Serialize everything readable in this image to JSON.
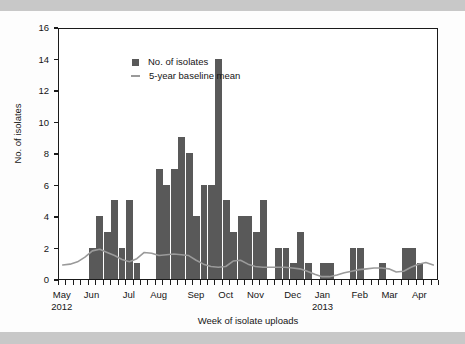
{
  "figure": {
    "background_color": "#fdfdfd",
    "band_color": "#c8c8c8",
    "bar_color": "#595959",
    "line_color": "#9a9a9a",
    "axis_color": "#1a1a1a"
  },
  "legend": {
    "position": "top-left-inside",
    "items": [
      {
        "label": "No. of isolates",
        "marker": "square-swatch",
        "color": "#595959"
      },
      {
        "label": "5-year baseline mean",
        "marker": "line-swatch",
        "color": "#9a9a9a"
      }
    ]
  },
  "axes": {
    "y": {
      "title": "No. of isolates",
      "ticks": [
        0,
        2,
        4,
        6,
        8,
        10,
        12,
        14,
        16
      ],
      "min": 0,
      "max": 16
    },
    "x": {
      "title": "Week of isolate uploads",
      "month_labels": [
        {
          "label": "May",
          "sublabel": "2012",
          "week_index": 0
        },
        {
          "label": "Jun",
          "sublabel": "",
          "week_index": 4
        },
        {
          "label": "Jul",
          "sublabel": "",
          "week_index": 9
        },
        {
          "label": "Aug",
          "sublabel": "",
          "week_index": 13
        },
        {
          "label": "Sep",
          "sublabel": "",
          "week_index": 18
        },
        {
          "label": "Oct",
          "sublabel": "",
          "week_index": 22
        },
        {
          "label": "Nov",
          "sublabel": "",
          "week_index": 26
        },
        {
          "label": "Dec",
          "sublabel": "",
          "week_index": 31
        },
        {
          "label": "Jan",
          "sublabel": "2013",
          "week_index": 35
        },
        {
          "label": "Feb",
          "sublabel": "",
          "week_index": 40
        },
        {
          "label": "Mar",
          "sublabel": "",
          "week_index": 44
        },
        {
          "label": "Apr",
          "sublabel": "",
          "week_index": 48
        }
      ],
      "n_weeks": 51
    }
  },
  "chart_data": {
    "type": "bar",
    "title": "",
    "subtitle": "",
    "xlabel": "Week of isolate uploads",
    "ylabel": "No. of isolates",
    "ylim": [
      0,
      16
    ],
    "grid": false,
    "legend_position": "upper left (inside plot)",
    "categories": [
      "May 2012 w1",
      "May 2012 w2",
      "May 2012 w3",
      "May 2012 w4",
      "Jun 2012 w1",
      "Jun 2012 w2",
      "Jun 2012 w3",
      "Jun 2012 w4",
      "Jun 2012 w5",
      "Jul 2012 w1",
      "Jul 2012 w2",
      "Jul 2012 w3",
      "Jul 2012 w4",
      "Aug 2012 w1",
      "Aug 2012 w2",
      "Aug 2012 w3",
      "Aug 2012 w4",
      "Aug 2012 w5",
      "Sep 2012 w1",
      "Sep 2012 w2",
      "Sep 2012 w3",
      "Sep 2012 w4",
      "Oct 2012 w1",
      "Oct 2012 w2",
      "Oct 2012 w3",
      "Oct 2012 w4",
      "Nov 2012 w1",
      "Nov 2012 w2",
      "Nov 2012 w3",
      "Nov 2012 w4",
      "Nov 2012 w5",
      "Dec 2012 w1",
      "Dec 2012 w2",
      "Dec 2012 w3",
      "Dec 2012 w4",
      "Jan 2013 w1",
      "Jan 2013 w2",
      "Jan 2013 w3",
      "Jan 2013 w4",
      "Jan 2013 w5",
      "Feb 2013 w1",
      "Feb 2013 w2",
      "Feb 2013 w3",
      "Feb 2013 w4",
      "Mar 2013 w1",
      "Mar 2013 w2",
      "Mar 2013 w3",
      "Mar 2013 w4",
      "Apr 2013 w1",
      "Apr 2013 w2",
      "Apr 2013 w3"
    ],
    "series": [
      {
        "name": "No. of isolates",
        "type": "bar",
        "color": "#595959",
        "values": [
          0,
          0,
          0,
          0,
          2,
          4,
          3,
          5,
          2,
          5,
          1,
          0,
          0,
          7,
          6,
          7,
          9,
          8,
          4,
          6,
          6,
          14,
          5,
          3,
          4,
          4,
          3,
          5,
          0,
          2,
          2,
          1,
          3,
          1,
          0,
          1,
          1,
          0,
          0,
          2,
          2,
          0,
          0,
          1,
          0,
          0,
          2,
          2,
          1,
          0,
          0
        ]
      },
      {
        "name": "5-year baseline mean",
        "type": "line",
        "color": "#9a9a9a",
        "values": [
          0.9,
          0.95,
          1.1,
          1.4,
          1.8,
          1.9,
          1.7,
          1.5,
          1.25,
          1.1,
          1.3,
          1.7,
          1.65,
          1.5,
          1.55,
          1.6,
          1.55,
          1.5,
          1.2,
          0.95,
          0.8,
          0.75,
          0.8,
          1.15,
          1.2,
          0.95,
          0.8,
          0.75,
          0.75,
          0.75,
          0.75,
          0.7,
          0.65,
          0.5,
          0.3,
          0.15,
          0.15,
          0.25,
          0.4,
          0.5,
          0.6,
          0.65,
          0.7,
          0.7,
          0.65,
          0.45,
          0.5,
          0.75,
          0.95,
          1.05,
          0.9
        ]
      }
    ]
  }
}
